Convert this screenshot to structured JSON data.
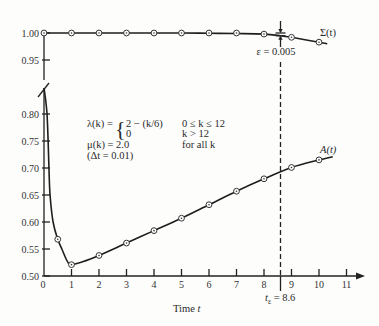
{
  "chart_data": {
    "type": "line",
    "title": "",
    "xlabel": "Time t",
    "ylabel": "",
    "xlim": [
      0,
      11
    ],
    "x_ticks": [
      0,
      1,
      2,
      3,
      4,
      5,
      6,
      7,
      8,
      9,
      10,
      11
    ],
    "y_axis_break": "between 0.80 and 0.95",
    "y_ticks_upper": [
      1.0,
      0.95
    ],
    "y_ticks_lower": [
      0.8,
      0.75,
      0.7,
      0.65,
      0.6,
      0.55,
      0.5
    ],
    "grid": false,
    "legend": "none (curves labeled inline)",
    "series": [
      {
        "name": "Σ(t)",
        "axis_section": "upper",
        "x": [
          0,
          1,
          2,
          3,
          4,
          5,
          6,
          7,
          8,
          9,
          10
        ],
        "values": [
          1.0,
          1.0,
          1.0,
          1.0,
          1.0,
          1.0,
          1.0,
          1.0,
          0.998,
          0.992,
          0.983
        ],
        "curve": [
          [
            0,
            1.0
          ],
          [
            1,
            1.0
          ],
          [
            2,
            1.0
          ],
          [
            3,
            1.0
          ],
          [
            4,
            1.0
          ],
          [
            5,
            1.0
          ],
          [
            6,
            0.9995
          ],
          [
            7,
            0.999
          ],
          [
            8,
            0.998
          ],
          [
            8.6,
            0.995
          ],
          [
            9,
            0.992
          ],
          [
            10,
            0.983
          ],
          [
            10.3,
            0.98
          ]
        ]
      },
      {
        "name": "A(t)",
        "axis_section": "lower",
        "x": [
          0.5,
          1,
          2,
          3,
          4,
          5,
          6,
          7,
          8,
          9,
          10
        ],
        "values": [
          0.568,
          0.521,
          0.538,
          0.561,
          0.584,
          0.607,
          0.632,
          0.657,
          0.68,
          0.701,
          0.715
        ],
        "curve": [
          [
            0,
            0.848
          ],
          [
            0.05,
            0.83
          ],
          [
            0.11,
            0.8
          ],
          [
            0.15,
            0.75
          ],
          [
            0.18,
            0.7
          ],
          [
            0.22,
            0.65
          ],
          [
            0.33,
            0.6
          ],
          [
            0.5,
            0.568
          ],
          [
            0.65,
            0.55
          ],
          [
            0.85,
            0.527
          ],
          [
            1,
            0.521
          ],
          [
            1.5,
            0.528
          ],
          [
            2,
            0.538
          ],
          [
            3,
            0.561
          ],
          [
            4,
            0.584
          ],
          [
            5,
            0.607
          ],
          [
            6,
            0.632
          ],
          [
            7,
            0.657
          ],
          [
            8,
            0.68
          ],
          [
            9,
            0.701
          ],
          [
            10,
            0.715
          ],
          [
            10.5,
            0.721
          ]
        ]
      }
    ],
    "annotations": {
      "t_epsilon": 8.6,
      "epsilon": 0.005
    }
  },
  "labels": {
    "sigma": "Σ(t)",
    "a": "A(t)",
    "epsilon": "ε = 0.005",
    "xlabel_word": "Time ",
    "xlabel_var": "t",
    "t_eps_var": "t",
    "t_eps_sub": "ε",
    "t_eps_value": " = 8.6"
  },
  "parameters": {
    "lambda_lhs": "λ(k) =",
    "brace": "{",
    "lambda_case1": "2 − (k/6)",
    "lambda_case2": "0",
    "cond1": "0 ≤ k ≤ 12",
    "cond2": "k > 12",
    "mu_def": "μ(k) = 2.0",
    "mu_cond": "for all k",
    "dt": "(Δt = 0.01)"
  }
}
